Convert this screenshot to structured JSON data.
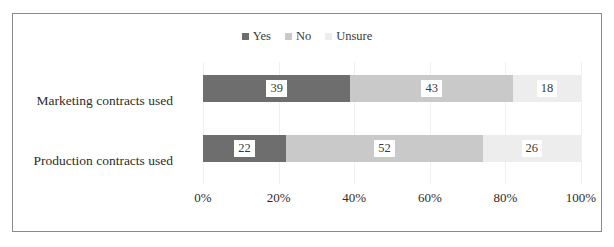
{
  "chart_data": {
    "type": "bar",
    "orientation": "horizontal",
    "stacked": true,
    "normalized": true,
    "title": "",
    "subtitle": "",
    "xlabel": "",
    "ylabel": "",
    "xlim": [
      0,
      100
    ],
    "xticks": [
      0,
      20,
      40,
      60,
      80,
      100
    ],
    "xtick_labels": [
      "0%",
      "20%",
      "40%",
      "60%",
      "80%",
      "100%"
    ],
    "grid": true,
    "grid_axis": "x",
    "legend_position": "top-center",
    "categories": [
      "Marketing contracts used",
      "Production contracts used"
    ],
    "series": [
      {
        "name": "Yes",
        "color": "#6e6e6e",
        "values": [
          39,
          22
        ],
        "labels": [
          "39",
          "22"
        ]
      },
      {
        "name": "No",
        "color": "#c9c9c9",
        "values": [
          43,
          52
        ],
        "labels": [
          "43",
          "52"
        ]
      },
      {
        "name": "Unsure",
        "color": "#ededed",
        "values": [
          18,
          26
        ],
        "labels": [
          "18",
          "26"
        ]
      }
    ]
  },
  "legend": {
    "items": [
      {
        "label": "Yes",
        "color": "#6e6e6e"
      },
      {
        "label": "No",
        "color": "#c9c9c9"
      },
      {
        "label": "Unsure",
        "color": "#ededed"
      }
    ]
  },
  "axis": {
    "x_tick_labels": [
      "0%",
      "20%",
      "40%",
      "60%",
      "80%",
      "100%"
    ]
  },
  "categories": {
    "items": [
      "Marketing contracts used",
      "Production contracts used"
    ]
  },
  "colors": {
    "yes": "#6e6e6e",
    "no": "#c9c9c9",
    "unsure": "#ededed",
    "border": "#8a8a8a",
    "gridline": "#f0f0f0",
    "text": "#2d2d2d",
    "background": "#ffffff"
  }
}
